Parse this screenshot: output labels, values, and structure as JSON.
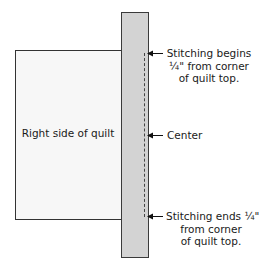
{
  "diagram": {
    "quilt": {
      "label": "Right side of quilt",
      "fill_color": "#f7f7f7",
      "border_color": "#333333"
    },
    "binding_strip": {
      "fill_color": "#d3d3d3",
      "border_color": "#3a3a3a"
    },
    "stitching_line": {
      "style": "dashed",
      "color": "#444444"
    },
    "callouts": [
      {
        "id": "stitch-begin",
        "lines": [
          "Stitching begins",
          "¼\" from corner",
          "of quilt top."
        ],
        "arrow": "arrow-left-icon"
      },
      {
        "id": "center",
        "lines": [
          "Center"
        ],
        "arrow": "arrow-left-icon"
      },
      {
        "id": "stitch-end",
        "lines": [
          "Stitching ends ¼\"",
          "from corner",
          "of quilt top."
        ],
        "arrow": "arrow-left-icon"
      }
    ]
  }
}
